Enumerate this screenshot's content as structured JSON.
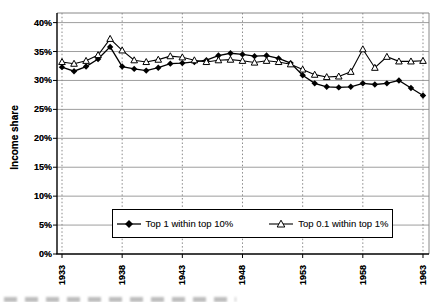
{
  "chart_data": {
    "type": "line",
    "title": "",
    "xlabel": "",
    "ylabel": "Income share",
    "ylim": [
      0,
      40
    ],
    "ytick_step": 5,
    "ytick_labels": [
      "0%",
      "5%",
      "10%",
      "15%",
      "20%",
      "25%",
      "30%",
      "35%",
      "40%"
    ],
    "xtick_years": [
      1933,
      1938,
      1943,
      1948,
      1953,
      1958,
      1963
    ],
    "xtick_labels": [
      "1933",
      "1938",
      "1943",
      "1948",
      "1953",
      "1958",
      "1963"
    ],
    "grid": {
      "horizontal": "solid-gray",
      "vertical": "dotted-gray-at-labeled-years"
    },
    "legend_position": "bottom-center-inside",
    "x": [
      1933,
      1934,
      1935,
      1936,
      1937,
      1938,
      1939,
      1940,
      1941,
      1942,
      1943,
      1944,
      1945,
      1946,
      1947,
      1948,
      1949,
      1950,
      1951,
      1952,
      1953,
      1954,
      1955,
      1956,
      1957,
      1958,
      1959,
      1960,
      1961,
      1962,
      1963
    ],
    "series": [
      {
        "name": "Top 1 within top 10%",
        "marker": "filled-diamond",
        "color": "#000000",
        "values": [
          32.3,
          31.6,
          32.4,
          33.7,
          35.8,
          32.4,
          32.0,
          31.7,
          32.2,
          32.9,
          33.0,
          33.2,
          33.5,
          34.3,
          34.7,
          34.5,
          34.2,
          34.3,
          33.8,
          33.0,
          30.9,
          29.5,
          28.9,
          28.8,
          28.9,
          29.5,
          29.3,
          29.5,
          30.0,
          28.7,
          27.4
        ]
      },
      {
        "name": "Top 0.1 within top 1%",
        "marker": "open-triangle",
        "color": "#000000",
        "values": [
          33.2,
          32.9,
          33.4,
          34.4,
          37.2,
          35.2,
          33.5,
          33.2,
          33.6,
          34.2,
          34.0,
          33.5,
          33.2,
          33.5,
          33.6,
          33.4,
          33.1,
          33.4,
          33.2,
          32.8,
          31.9,
          31.0,
          30.6,
          30.7,
          31.5,
          35.4,
          32.2,
          34.1,
          33.3,
          33.3,
          33.4
        ]
      }
    ],
    "colors": {
      "line": "#000000",
      "grid_solid": "#9e9e9e",
      "grid_dotted": "#8a8a8a",
      "axis": "#000000",
      "border_light": "#888888",
      "background": "#ffffff"
    }
  }
}
